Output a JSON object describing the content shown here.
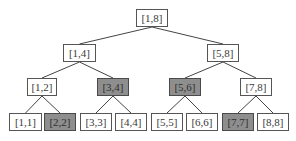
{
  "diagram": {
    "type": "segment-tree",
    "colors": {
      "highlight_fill": "#8e8e8e",
      "normal_fill": "#ffffff",
      "border": "#555555",
      "edge": "#444444"
    },
    "nodes": [
      {
        "id": "n18",
        "label": "[1,8]",
        "highlighted": false,
        "x": 136,
        "y": 9,
        "w": 32
      },
      {
        "id": "n14",
        "label": "[1,4]",
        "highlighted": false,
        "x": 63,
        "y": 44,
        "w": 33
      },
      {
        "id": "n58",
        "label": "[5,8]",
        "highlighted": false,
        "x": 207,
        "y": 44,
        "w": 32
      },
      {
        "id": "n12",
        "label": "[1,2]",
        "highlighted": false,
        "x": 27,
        "y": 78,
        "w": 30
      },
      {
        "id": "n34",
        "label": "[3,4]",
        "highlighted": true,
        "x": 97,
        "y": 78,
        "w": 32
      },
      {
        "id": "n56",
        "label": "[5,6]",
        "highlighted": true,
        "x": 169,
        "y": 78,
        "w": 32
      },
      {
        "id": "n78",
        "label": "[7,8]",
        "highlighted": false,
        "x": 240,
        "y": 78,
        "w": 32
      },
      {
        "id": "n11",
        "label": "[1,1]",
        "highlighted": false,
        "x": 9,
        "y": 113,
        "w": 33
      },
      {
        "id": "n22",
        "label": "[2,2]",
        "highlighted": true,
        "x": 44,
        "y": 113,
        "w": 32
      },
      {
        "id": "n33",
        "label": "[3,3]",
        "highlighted": false,
        "x": 80,
        "y": 113,
        "w": 32
      },
      {
        "id": "n44",
        "label": "[4,4]",
        "highlighted": false,
        "x": 115,
        "y": 113,
        "w": 32
      },
      {
        "id": "n55",
        "label": "[5,5]",
        "highlighted": false,
        "x": 151,
        "y": 113,
        "w": 32
      },
      {
        "id": "n66",
        "label": "[6,6]",
        "highlighted": false,
        "x": 186,
        "y": 113,
        "w": 32
      },
      {
        "id": "n77",
        "label": "[7,7]",
        "highlighted": true,
        "x": 222,
        "y": 113,
        "w": 32
      },
      {
        "id": "n88",
        "label": "[8,8]",
        "highlighted": false,
        "x": 257,
        "y": 113,
        "w": 32
      }
    ],
    "edges": [
      [
        "n18",
        "n14"
      ],
      [
        "n18",
        "n58"
      ],
      [
        "n14",
        "n12"
      ],
      [
        "n14",
        "n34"
      ],
      [
        "n58",
        "n56"
      ],
      [
        "n58",
        "n78"
      ],
      [
        "n12",
        "n11"
      ],
      [
        "n12",
        "n22"
      ],
      [
        "n34",
        "n33"
      ],
      [
        "n34",
        "n44"
      ],
      [
        "n56",
        "n55"
      ],
      [
        "n56",
        "n66"
      ],
      [
        "n78",
        "n77"
      ],
      [
        "n78",
        "n88"
      ]
    ]
  }
}
